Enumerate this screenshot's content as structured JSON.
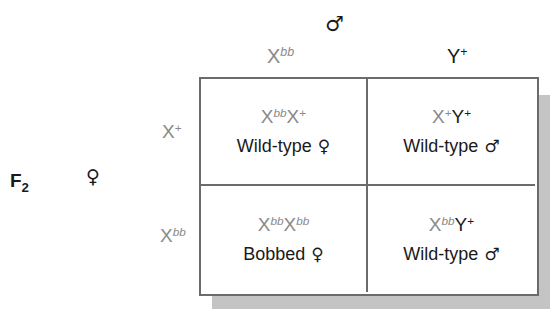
{
  "generation": {
    "label": "F",
    "subscript": "2"
  },
  "male_parent": {
    "symbol": "♂"
  },
  "female_parent": {
    "symbol": "♀"
  },
  "columns": [
    {
      "base": "X",
      "allele": "bb"
    },
    {
      "base": "Y",
      "allele": "+"
    }
  ],
  "rows": [
    {
      "base": "X",
      "allele": "+"
    },
    {
      "base": "X",
      "allele": "bb"
    }
  ],
  "cells": [
    {
      "g1": "X",
      "a1": "bb",
      "g2": "X",
      "a2": "+",
      "phenotype": "Wild-type",
      "sex": "♀"
    },
    {
      "g1": "X",
      "a1": "+",
      "g2": "Y",
      "a2": "+",
      "phenotype": "Wild-type",
      "sex": "♂"
    },
    {
      "g1": "X",
      "a1": "bb",
      "g2": "X",
      "a2": "bb",
      "phenotype": "Bobbed",
      "sex": "♀"
    },
    {
      "g1": "X",
      "a1": "bb",
      "g2": "Y",
      "a2": "+",
      "phenotype": "Wild-type",
      "sex": "♂"
    }
  ],
  "colors": {
    "allele_gray": "#8a8a8a",
    "text_dark": "#1a1a1a",
    "border": "#6b6b6b",
    "shadow": "#c4c4c4"
  }
}
